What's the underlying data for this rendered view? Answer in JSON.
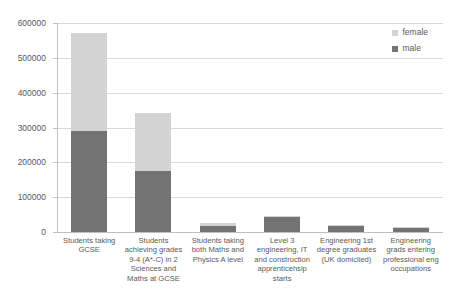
{
  "chart_data": {
    "type": "bar",
    "subtype": "stacked-bar",
    "title": "",
    "xlabel": "",
    "ylabel": "",
    "ylim": [
      0,
      600000
    ],
    "ytick_labels": [
      "600000",
      "500000",
      "400000",
      "300000",
      "200000",
      "100000",
      "0"
    ],
    "ytick_values": [
      600000,
      500000,
      400000,
      300000,
      200000,
      100000,
      0
    ],
    "grid": "horizontal",
    "legend_position": "top-right",
    "categories": [
      "Students taking GCSE",
      "Students achieving grades 9-4 (A*-C) in 2 Sciences and Maths at GCSE",
      "Students taking both Maths and Physics A level",
      "Level 3 engineering, IT and construction apprenticehsip starts",
      "Engineering 1st degree graduates (UK domiclied)",
      "Engineering grads entering professional eng occupations"
    ],
    "series": [
      {
        "name": "male",
        "color": "#737373",
        "values": [
          289000,
          175000,
          18000,
          44000,
          16000,
          11000
        ]
      },
      {
        "name": "female",
        "color": "#d3d3d3",
        "values": [
          281000,
          167000,
          9000,
          3000,
          3000,
          2000
        ]
      }
    ],
    "totals": [
      570000,
      342000,
      27000,
      47000,
      19000,
      13000
    ]
  },
  "legend": {
    "items": [
      {
        "label": "female",
        "color": "#d3d3d3"
      },
      {
        "label": "male",
        "color": "#737373"
      }
    ]
  },
  "colors": {
    "female": "#d3d3d3",
    "male": "#737373",
    "gridline": "#d9d9d9",
    "axis": "#bfbfbf",
    "text": "#595959",
    "background": "#ffffff"
  }
}
